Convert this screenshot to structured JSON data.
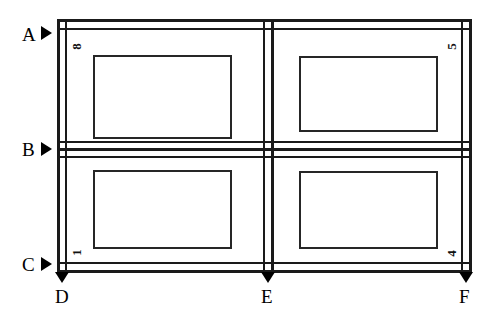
{
  "diagram": {
    "type": "panel-grid-elevation",
    "background_color": "#ffffff",
    "line_color": "#1a1a1a",
    "rows": 2,
    "columns": 2,
    "quadrants": [
      {
        "id": "top-left",
        "label": "8",
        "row": 0,
        "column": 0
      },
      {
        "id": "top-right",
        "label": "5",
        "row": 0,
        "column": 1
      },
      {
        "id": "bottom-left",
        "label": "1",
        "row": 1,
        "column": 0
      },
      {
        "id": "bottom-right",
        "label": "4",
        "row": 1,
        "column": 1
      }
    ],
    "horizontal_references": [
      {
        "id": "A",
        "label": "A",
        "marker": "triangle-right"
      },
      {
        "id": "B",
        "label": "B",
        "marker": "triangle-right"
      },
      {
        "id": "C",
        "label": "C",
        "marker": "triangle-right"
      }
    ],
    "vertical_references": [
      {
        "id": "D",
        "label": "D",
        "marker": "triangle-down"
      },
      {
        "id": "E",
        "label": "E",
        "marker": "triangle-down"
      },
      {
        "id": "F",
        "label": "F",
        "marker": "triangle-down"
      }
    ]
  }
}
